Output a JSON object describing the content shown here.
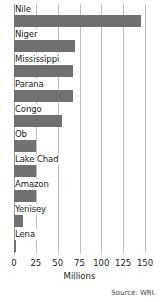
{
  "chart_data": {
    "type": "bar",
    "orientation": "horizontal",
    "title": "",
    "subtitle": "",
    "xlabel": "Millions",
    "ylabel": "",
    "xlim": [
      0,
      150
    ],
    "xticks": [
      0,
      25,
      50,
      75,
      100,
      125,
      150
    ],
    "xtick_labels": [
      "0",
      "25",
      "50",
      "75",
      "100",
      "125",
      "150"
    ],
    "grid": true,
    "legend": false,
    "legend_position": "none",
    "bar_color": "#707070",
    "gridline_color": "#bdbdbd",
    "background_color": "#ffffff",
    "text_color": "#1a1a1a",
    "categories": [
      "Nile",
      "Niger",
      "Mississippi",
      "Parana",
      "Congo",
      "Ob",
      "Lake Chad",
      "Amazon",
      "Yenisey",
      "Lena"
    ],
    "values": [
      145,
      70,
      68,
      68,
      55,
      25,
      25,
      25,
      10,
      2
    ],
    "series": [
      {
        "name": "Population",
        "values": [
          145,
          70,
          68,
          68,
          55,
          25,
          25,
          25,
          10,
          2
        ]
      }
    ],
    "annotations": [
      "Source: WRI."
    ]
  },
  "footer": {
    "source": "Source: WRI."
  }
}
